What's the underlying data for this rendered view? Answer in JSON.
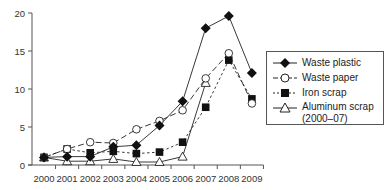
{
  "chart_data": {
    "type": "line",
    "title": "",
    "xlabel": "",
    "ylabel": "",
    "x": [
      2000,
      2001,
      2002,
      2003,
      2004,
      2005,
      2006,
      2007,
      2008,
      2009
    ],
    "x_tick_labels": [
      "2000",
      "2001",
      "2002",
      "2003",
      "2004",
      "2005",
      "2006",
      "2007",
      "2008",
      "2009"
    ],
    "y_ticks": [
      0,
      5,
      10,
      15,
      20
    ],
    "y_tick_labels": [
      "0",
      "5",
      "10",
      "15",
      "20"
    ],
    "ylim": [
      0,
      20
    ],
    "grid": false,
    "legend_position": "right",
    "series": [
      {
        "name": "Waste plastic",
        "marker": "filled-diamond",
        "line": "solid",
        "values": [
          1.0,
          1.1,
          1.1,
          2.4,
          2.6,
          5.2,
          8.4,
          18.0,
          19.6,
          12.1
        ]
      },
      {
        "name": "Waste paper",
        "marker": "open-circle",
        "line": "long-dash",
        "values": [
          1.0,
          2.1,
          3.0,
          2.9,
          4.7,
          5.8,
          7.2,
          11.4,
          14.7,
          8.1
        ]
      },
      {
        "name": "Iron scrap",
        "marker": "filled-square",
        "line": "short-dash",
        "values": [
          1.0,
          2.1,
          1.6,
          1.8,
          1.5,
          1.7,
          3.0,
          7.6,
          13.8,
          8.7
        ]
      },
      {
        "name": "Aluminum scrap\n(2000–07)",
        "marker": "open-triangle",
        "line": "solid",
        "values": [
          1.0,
          0.5,
          0.5,
          0.8,
          0.4,
          0.4,
          1.1,
          10.8,
          null,
          null
        ]
      }
    ]
  },
  "legend": {
    "items": [
      {
        "label": "Waste plastic"
      },
      {
        "label": "Waste paper"
      },
      {
        "label": "Iron scrap"
      },
      {
        "label": "Aluminum scrap",
        "label2": "(2000–07)"
      }
    ]
  }
}
